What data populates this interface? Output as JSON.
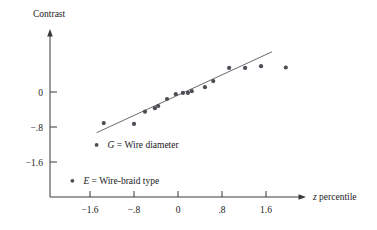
{
  "figure": {
    "background_color": "#ffffff",
    "ink_color": "#1a1a1a",
    "point_color": "#4d4d55",
    "line_color": "#5a5a5a",
    "width": 377,
    "height": 230
  },
  "chart_data": {
    "type": "scatter",
    "title": "",
    "xlabel": "z percentile",
    "ylabel": "Contrast",
    "xlabel_italic_prefix": "z",
    "xlabel_rest": " percentile",
    "xlim": [
      -2.3,
      2.3
    ],
    "ylim": [
      -2.0,
      1.1
    ],
    "grid": false,
    "legend_position": "inside-lower-left",
    "xticks": [
      -1.6,
      -0.8,
      0,
      0.8,
      1.6
    ],
    "xticklabels": [
      "−1.6",
      "−.8",
      "0",
      ".8",
      "1.6"
    ],
    "yticks": [
      0,
      -0.8,
      -1.6
    ],
    "yticklabels": [
      "0",
      "−.8",
      "−1.6"
    ],
    "points": [
      {
        "x": -1.35,
        "y": -0.71
      },
      {
        "x": -0.8,
        "y": -0.73
      },
      {
        "x": -0.6,
        "y": -0.45
      },
      {
        "x": -0.42,
        "y": -0.37
      },
      {
        "x": -0.36,
        "y": -0.32
      },
      {
        "x": -0.2,
        "y": -0.16
      },
      {
        "x": -0.04,
        "y": -0.05
      },
      {
        "x": 0.09,
        "y": -0.02
      },
      {
        "x": 0.18,
        "y": -0.02
      },
      {
        "x": 0.25,
        "y": 0.02
      },
      {
        "x": 0.49,
        "y": 0.11
      },
      {
        "x": 0.64,
        "y": 0.25
      },
      {
        "x": 0.93,
        "y": 0.55
      },
      {
        "x": 1.22,
        "y": 0.55
      },
      {
        "x": 1.51,
        "y": 0.59
      },
      {
        "x": 1.96,
        "y": 0.56
      }
    ],
    "fit_line": {
      "label": "reference line",
      "x_start": -1.48,
      "y_start": -0.93,
      "x_end": 1.71,
      "y_end": 0.92
    },
    "annotations": [
      {
        "id": "legend-g",
        "marker": true,
        "symbol": "G",
        "separator": "=",
        "text": "Wire diameter",
        "full_text": "G = Wire diameter",
        "x": -1.48,
        "y": -1.21
      },
      {
        "id": "legend-e",
        "marker": true,
        "symbol": "E",
        "separator": "=",
        "text": "Wire-braid type",
        "full_text": "E = Wire-braid type",
        "x": -1.92,
        "y": -2.03
      }
    ]
  }
}
